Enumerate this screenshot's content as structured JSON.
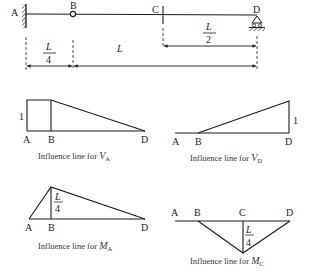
{
  "beam": {
    "points": [
      {
        "id": "A",
        "label": "A",
        "x": 26,
        "support": "fixed"
      },
      {
        "id": "B",
        "label": "B",
        "x": 73,
        "support": "hinge"
      },
      {
        "id": "C",
        "label": "C",
        "x": 163,
        "support": "section"
      },
      {
        "id": "D",
        "label": "D",
        "x": 257,
        "support": "roller"
      }
    ],
    "dimensions": {
      "cd": {
        "num": "L",
        "den": "2"
      },
      "ab": {
        "num": "L",
        "den": "4"
      },
      "bd": {
        "label": "L"
      }
    }
  },
  "influence_lines": [
    {
      "id": "VA",
      "caption_prefix": "Influence line for ",
      "quantity": "V",
      "subscript": "A",
      "points": [
        "A",
        "B",
        "D"
      ],
      "ordinate_label": "1"
    },
    {
      "id": "VD",
      "caption_prefix": "Influence line for ",
      "quantity": "V",
      "subscript": "D",
      "points": [
        "A",
        "B",
        "D"
      ],
      "ordinate_label": "1"
    },
    {
      "id": "MA",
      "caption_prefix": "Influence line for ",
      "quantity": "M",
      "subscript": "A",
      "points": [
        "A",
        "B",
        "D"
      ],
      "ordinate": {
        "num": "L",
        "den": "4"
      }
    },
    {
      "id": "MC",
      "caption_prefix": "Influence line for ",
      "quantity": "M",
      "subscript": "C",
      "points": [
        "A",
        "B",
        "C",
        "D"
      ],
      "ordinate": {
        "num": "L",
        "den": "4"
      }
    }
  ],
  "colors": {
    "line": "#1a1a1a",
    "text": "#1a1a1a",
    "background": "#ffffff"
  }
}
